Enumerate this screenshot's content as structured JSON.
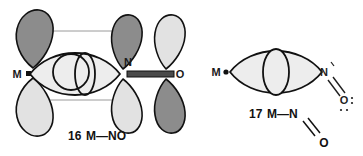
{
  "figure": {
    "background_color": "#ffffff",
    "stroke_color": "#111111",
    "lobe_dark_fill": "#8c8c8c",
    "lobe_light_fill": "#e2e2e2",
    "lens_fill": "#ededed",
    "connector_color": "#9a9a9a",
    "bond_bar_color": "#4a4a4a"
  },
  "structures": [
    {
      "id": "structure-16",
      "caption_number": "16",
      "caption_formula": "M—NO",
      "geometry": "linear",
      "atoms": [
        {
          "symbol": "M",
          "role": "metal",
          "has_dot": true
        },
        {
          "symbol": "N",
          "role": "nitrogen",
          "has_dot": false
        },
        {
          "symbol": "O",
          "role": "oxygen",
          "has_dot": false
        }
      ],
      "lobes": [
        {
          "atom": "M",
          "position": "top",
          "shade": "dark"
        },
        {
          "atom": "M",
          "position": "bottom",
          "shade": "light"
        },
        {
          "atom": "N",
          "position": "top",
          "shade": "dark"
        },
        {
          "atom": "N",
          "position": "bottom",
          "shade": "light"
        },
        {
          "atom": "O",
          "position": "top",
          "shade": "light"
        },
        {
          "atom": "O",
          "position": "bottom",
          "shade": "dark"
        }
      ],
      "connectors": [
        {
          "from": "M-top",
          "to": "N-top"
        },
        {
          "from": "M-bottom",
          "to": "N-bottom"
        }
      ],
      "sigma_lens": {
        "between": "M-N",
        "inner_circle": true,
        "inner_ellipse": true
      },
      "bond_bar": {
        "between": "N-O",
        "style": "thick-double"
      }
    },
    {
      "id": "structure-17",
      "caption_number": "17",
      "caption_formula_left": "M—N",
      "caption_formula_oxygen": "O",
      "geometry": "bent",
      "atoms": [
        {
          "symbol": "M",
          "role": "metal",
          "has_dot": true
        },
        {
          "symbol": "N",
          "role": "nitrogen",
          "has_dot": true
        },
        {
          "symbol": "O",
          "role": "oxygen",
          "has_dot": true
        }
      ],
      "sigma_lens": {
        "between": "M-N",
        "inner_lens": true
      },
      "lewis": {
        "nitrogen_symbol": "N",
        "oxygen_symbol": "O",
        "double_bond": true,
        "nitrogen_lone_pair": true,
        "oxygen_lone_pairs": true
      }
    }
  ]
}
